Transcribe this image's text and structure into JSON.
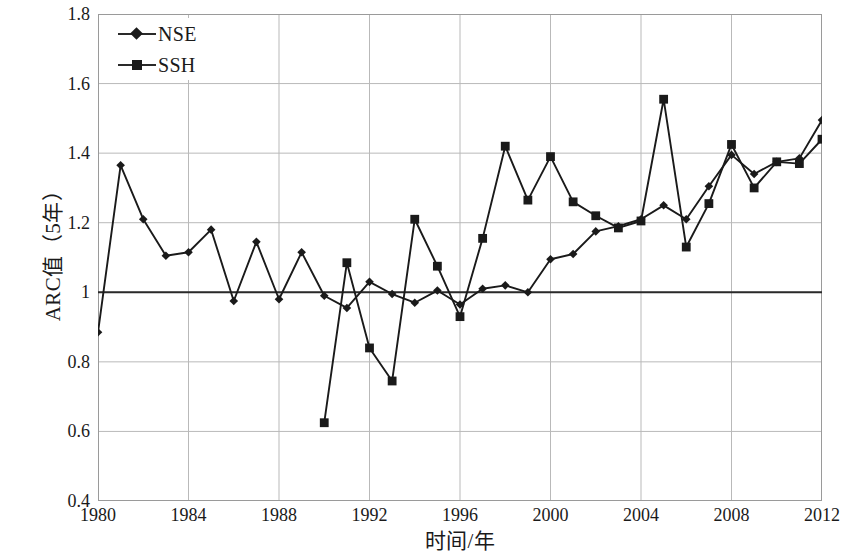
{
  "chart_data": {
    "type": "line",
    "title": "",
    "xlabel": "时间/年",
    "ylabel": "ARC值（5年）",
    "xlim": [
      1980,
      2012
    ],
    "ylim": [
      0.4,
      1.8
    ],
    "xticks": [
      1980,
      1984,
      1988,
      1992,
      1996,
      2000,
      2004,
      2008,
      2012
    ],
    "ytick_labels": [
      "0.4",
      "0.6",
      "0.8",
      "1",
      "1.2",
      "1.4",
      "1.6",
      "1.8"
    ],
    "yticks": [
      0.4,
      0.6,
      0.8,
      1.0,
      1.2,
      1.4,
      1.6,
      1.8
    ],
    "grid": true,
    "legend_position": "top-left",
    "reference_line": 1.0,
    "x": [
      1980,
      1981,
      1982,
      1983,
      1984,
      1985,
      1986,
      1987,
      1988,
      1989,
      1990,
      1991,
      1992,
      1993,
      1994,
      1995,
      1996,
      1997,
      1998,
      1999,
      2000,
      2001,
      2002,
      2003,
      2004,
      2005,
      2006,
      2007,
      2008,
      2009,
      2010,
      2011,
      2012
    ],
    "series": [
      {
        "name": "NSE",
        "marker": "diamond",
        "color": "#1a1a1a",
        "x": [
          1980,
          1981,
          1982,
          1983,
          1984,
          1985,
          1986,
          1987,
          1988,
          1989,
          1990,
          1991,
          1992,
          1993,
          1994,
          1995,
          1996,
          1997,
          1998,
          1999,
          2000,
          2001,
          2002,
          2003,
          2004,
          2005,
          2006,
          2007,
          2008,
          2009,
          2010,
          2011,
          2012
        ],
        "values": [
          0.885,
          1.365,
          1.21,
          1.105,
          1.115,
          1.18,
          0.975,
          1.145,
          0.98,
          1.115,
          0.99,
          0.955,
          1.03,
          0.995,
          0.97,
          1.005,
          0.965,
          1.01,
          1.02,
          1.0,
          1.095,
          1.11,
          1.175,
          1.19,
          1.21,
          1.25,
          1.21,
          1.305,
          1.395,
          1.34,
          1.375,
          1.385,
          1.495
        ]
      },
      {
        "name": "SSH",
        "marker": "square",
        "color": "#1a1a1a",
        "x": [
          1990,
          1991,
          1992,
          1993,
          1994,
          1995,
          1996,
          1997,
          1998,
          1999,
          2000,
          2001,
          2002,
          2003,
          2004,
          2005,
          2006,
          2007,
          2008,
          2009,
          2010,
          2011,
          2012
        ],
        "values": [
          0.625,
          1.085,
          0.84,
          0.745,
          1.21,
          1.075,
          0.93,
          1.155,
          1.42,
          1.265,
          1.39,
          1.26,
          1.22,
          1.185,
          1.205,
          1.555,
          1.13,
          1.255,
          1.425,
          1.3,
          1.375,
          1.37,
          1.44
        ]
      }
    ]
  },
  "legend": {
    "entries": [
      {
        "label": "NSE",
        "marker": "diamond"
      },
      {
        "label": "SSH",
        "marker": "square"
      }
    ]
  }
}
